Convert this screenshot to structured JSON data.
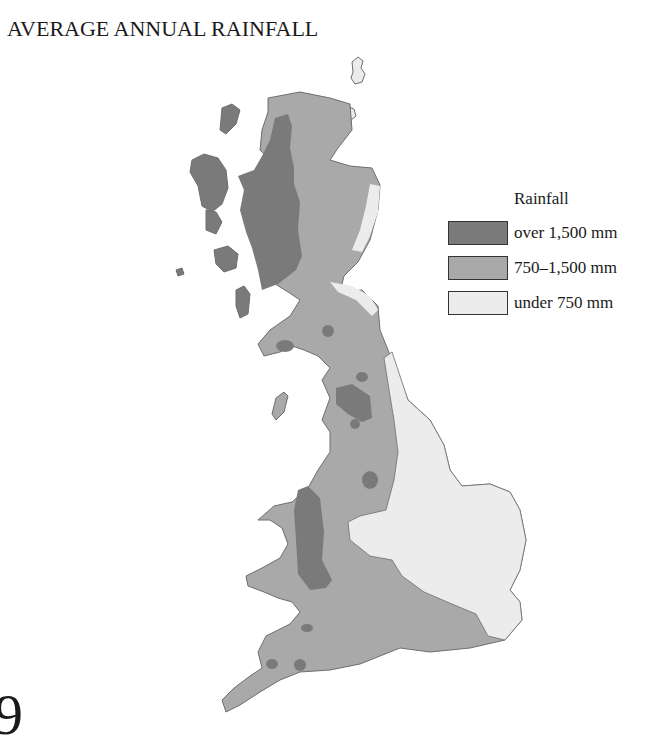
{
  "title": "AVERAGE ANNUAL RAINFALL",
  "legend": {
    "title": "Rainfall",
    "items": [
      {
        "label": "over 1,500 mm",
        "color": "#7a7a7a"
      },
      {
        "label": "750–1,500 mm",
        "color": "#a9a9a9"
      },
      {
        "label": "under 750 mm",
        "color": "#ececec"
      }
    ]
  },
  "colors": {
    "high": "#7a7a7a",
    "medium": "#a9a9a9",
    "low": "#ececec",
    "outline": "#6e6e6e"
  },
  "page_fragment": "9"
}
